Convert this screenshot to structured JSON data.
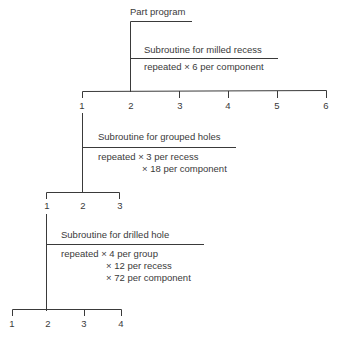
{
  "root": {
    "label": "Part program"
  },
  "levels": [
    {
      "title": "Subroutine for milled recess",
      "repeats": [
        "repeated × 6 per component"
      ],
      "nodes": [
        "1",
        "2",
        "3",
        "4",
        "5",
        "6"
      ]
    },
    {
      "title": "Subroutine for grouped holes",
      "repeats": [
        "repeated × 3 per recess",
        "× 18 per component"
      ],
      "nodes": [
        "1",
        "2",
        "3"
      ]
    },
    {
      "title": "Subroutine for drilled hole",
      "repeats": [
        "repeated × 4 per group",
        "× 12 per recess",
        "× 72 per component"
      ],
      "nodes": [
        "1",
        "2",
        "3",
        "4"
      ]
    }
  ]
}
